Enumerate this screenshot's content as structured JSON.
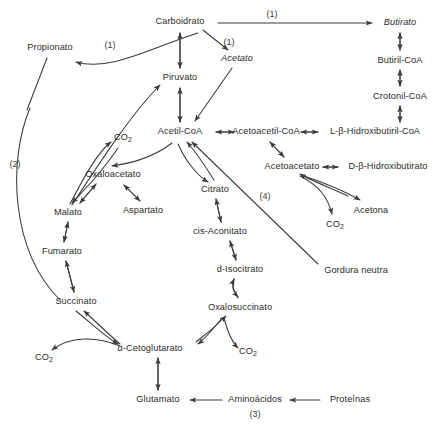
{
  "diagram": {
    "stroke_color": "#3a3a3a",
    "text_color": "#2b2b2b",
    "background": "#ffffff",
    "nodes": [
      {
        "id": "carboidrato",
        "label": "Carboidrato",
        "x": 180,
        "y": 22,
        "italic": false
      },
      {
        "id": "butirato",
        "label": "Butirato",
        "x": 400,
        "y": 23,
        "italic": true
      },
      {
        "id": "propionato",
        "label": "Propionato",
        "x": 50,
        "y": 48,
        "italic": false
      },
      {
        "id": "acetato",
        "label": "Acetato",
        "x": 237,
        "y": 59,
        "italic": true
      },
      {
        "id": "butiril-coa",
        "label": "Butiril-CoA",
        "x": 400,
        "y": 61,
        "italic": false
      },
      {
        "id": "piruvato",
        "label": "Piruvato",
        "x": 180,
        "y": 78,
        "italic": false
      },
      {
        "id": "crotonil-coa",
        "label": "Crotonil-CoA",
        "x": 400,
        "y": 97,
        "italic": false
      },
      {
        "id": "co2-oxaloacetato",
        "label": "CO2",
        "x": 123,
        "y": 138,
        "italic": false
      },
      {
        "id": "acetil-coa",
        "label": "Acetil-CoA",
        "x": 180,
        "y": 132,
        "italic": false
      },
      {
        "id": "acetoacetil-coa",
        "label": "Acetoacetil-CoA",
        "x": 266,
        "y": 132,
        "italic": false
      },
      {
        "id": "l-b-hidroxibutiril-coa",
        "label": "L-β-Hidroxibutiril-CoA",
        "x": 375,
        "y": 132,
        "italic": false
      },
      {
        "id": "acetoacetato",
        "label": "Acetoacetato",
        "x": 292,
        "y": 167,
        "italic": false
      },
      {
        "id": "d-b-hidroxibutirato",
        "label": "D-β-Hidroxibutirato",
        "x": 388,
        "y": 167,
        "italic": false
      },
      {
        "id": "oxaloacetato",
        "label": "Oxaloacetato",
        "x": 113,
        "y": 175,
        "italic": false
      },
      {
        "id": "citrato",
        "label": "Citrato",
        "x": 215,
        "y": 190,
        "italic": false
      },
      {
        "id": "acetona",
        "label": "Acetona",
        "x": 371,
        "y": 211,
        "italic": false
      },
      {
        "id": "aspartato",
        "label": "Aspartato",
        "x": 143,
        "y": 211,
        "italic": false
      },
      {
        "id": "malato",
        "label": "Malato",
        "x": 68,
        "y": 213,
        "italic": false
      },
      {
        "id": "co2-acetona",
        "label": "CO2",
        "x": 335,
        "y": 225,
        "italic": false
      },
      {
        "id": "cis-aconitato",
        "label": "cis-Aconitato",
        "x": 220,
        "y": 232,
        "italic": false
      },
      {
        "id": "fumarato",
        "label": "Fumarato",
        "x": 62,
        "y": 252,
        "italic": false
      },
      {
        "id": "d-isocitrato",
        "label": "d-Isocitrato",
        "x": 240,
        "y": 270,
        "italic": false
      },
      {
        "id": "gordura-neutra",
        "label": "Gordura neutra",
        "x": 356,
        "y": 271,
        "italic": false
      },
      {
        "id": "succinato",
        "label": "Succinato",
        "x": 76,
        "y": 302,
        "italic": false
      },
      {
        "id": "oxalosuccinato",
        "label": "Oxalosuccinato",
        "x": 240,
        "y": 308,
        "italic": false
      },
      {
        "id": "alfa-cetoglutarato",
        "label": "α-Cetoglutarato",
        "x": 150,
        "y": 349,
        "italic": false
      },
      {
        "id": "co2-succinato",
        "label": "CO2",
        "x": 44,
        "y": 358,
        "italic": false
      },
      {
        "id": "co2-oxalosuccinato",
        "label": "CO2",
        "x": 248,
        "y": 352,
        "italic": false
      },
      {
        "id": "glutamato",
        "label": "Glutamato",
        "x": 158,
        "y": 400,
        "italic": false
      },
      {
        "id": "aminoacidos",
        "label": "Aminoácidos",
        "x": 255,
        "y": 400,
        "italic": false
      },
      {
        "id": "proteinas",
        "label": "Proteínas",
        "x": 350,
        "y": 400,
        "italic": false
      }
    ],
    "tags": [
      {
        "id": "tag-1-butirato",
        "label": "(1)",
        "x": 272,
        "y": 14
      },
      {
        "id": "tag-1-propionato",
        "label": "(1)",
        "x": 110,
        "y": 45
      },
      {
        "id": "tag-1-acetato",
        "label": "(1)",
        "x": 229,
        "y": 42
      },
      {
        "id": "tag-2-succinato",
        "label": "(2)",
        "x": 15,
        "y": 164
      },
      {
        "id": "tag-4-gordura",
        "label": "(4)",
        "x": 265,
        "y": 196
      },
      {
        "id": "tag-3-aminoacidos",
        "label": "(3)",
        "x": 255,
        "y": 414
      }
    ]
  }
}
